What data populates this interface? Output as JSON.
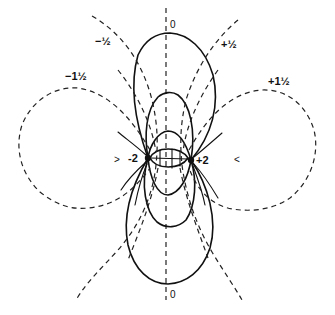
{
  "diagram": {
    "kind": "electric field lines and equipotentials of two charges",
    "charges": [
      {
        "label": "-2",
        "x": 148,
        "y": 158
      },
      {
        "label": "+2",
        "x": 191,
        "y": 160
      }
    ],
    "potential_labels": {
      "zero_top": "0",
      "zero_bottom": "0",
      "minus_half": "−½",
      "plus_half": "+½",
      "minus_one_half": "−1½",
      "plus_one_half": "+1½"
    },
    "side_marks": {
      "left": ">",
      "right": "<"
    },
    "colors": {
      "ink": "#111111",
      "background": "#ffffff"
    }
  }
}
